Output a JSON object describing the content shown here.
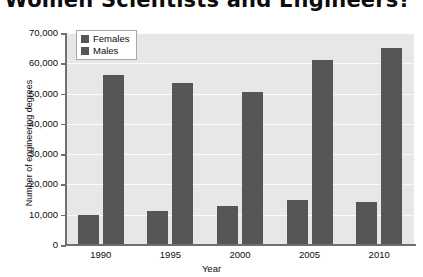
{
  "chart_data": {
    "type": "bar",
    "title": "re Women Scientists and Engineers?",
    "xlabel": "Year",
    "ylabel": "Number of engineering degrees",
    "categories": [
      "1990",
      "1995",
      "2000",
      "2005",
      "2010"
    ],
    "series": [
      {
        "name": "Females",
        "values": [
          10000,
          11200,
          12800,
          14700,
          14200
        ],
        "color": "#565656"
      },
      {
        "name": "Males",
        "values": [
          56000,
          53500,
          50500,
          61000,
          65000
        ],
        "color": "#565656"
      }
    ],
    "ylim": [
      0,
      70000
    ],
    "ytick_values": [
      0,
      10000,
      20000,
      30000,
      40000,
      50000,
      60000,
      70000
    ],
    "ytick_labels": [
      "0",
      "10,000",
      "20,000",
      "30,000",
      "40,000",
      "50,000",
      "60,000",
      "70,000"
    ],
    "grid": true,
    "legend_position": "top-left",
    "plot_background": "#e7e7e7",
    "gridline_color": "#fbfbfb",
    "axis_color": "#6f6f6f"
  }
}
